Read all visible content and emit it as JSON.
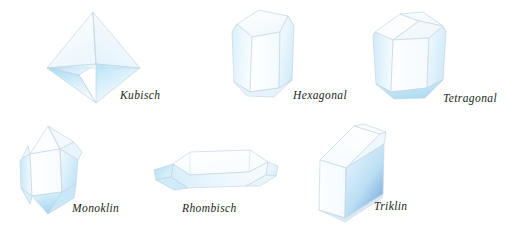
{
  "figure": {
    "background_color": "#ffffff",
    "outline_color": "#b9c9d6",
    "ink_color": "#231f20",
    "tint_light": "#eaf4fb",
    "tint_mid": "#cfe7f5",
    "tint_deep": "#9fd2ef",
    "tint_blue": "#7ba9de"
  },
  "crystals": [
    {
      "id": "kubisch",
      "label": "Kubisch",
      "shape": "octahedron",
      "icon": "crystal-octahedron-icon"
    },
    {
      "id": "hexagonal",
      "label": "Hexagonal",
      "shape": "hexagonal-prism",
      "icon": "crystal-hexagonal-prism-icon"
    },
    {
      "id": "tetragonal",
      "label": "Tetragonal",
      "shape": "tetragonal-prism",
      "icon": "crystal-tetragonal-prism-icon"
    },
    {
      "id": "monoklin",
      "label": "Monoklin",
      "shape": "monoclinic-prism",
      "icon": "crystal-monoclinic-icon"
    },
    {
      "id": "rhombisch",
      "label": "Rhombisch",
      "shape": "orthorhombic-tablet",
      "icon": "crystal-orthorhombic-icon"
    },
    {
      "id": "triklin",
      "label": "Triklin",
      "shape": "triclinic-block",
      "icon": "crystal-triclinic-icon"
    }
  ]
}
